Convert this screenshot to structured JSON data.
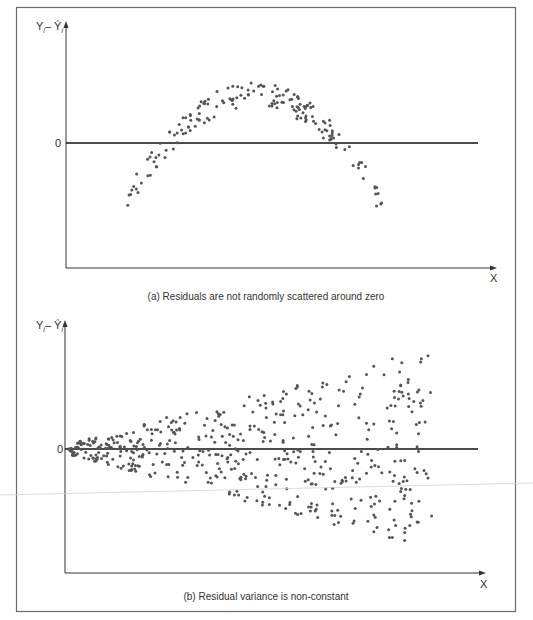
{
  "colors": {
    "frame": "#6a6a6a",
    "axis": "#333333",
    "zero_line": "#111111",
    "dot": "#555555",
    "stray_line": "#d0d0d0"
  },
  "chart_data": [
    {
      "type": "scatter",
      "title": "(a) Residuals are not randomly scattered around zero",
      "xlabel": "X",
      "ylabel": "Y_i − Ŷ_i",
      "ylabel_parts": {
        "main": "Y",
        "sub": "i",
        "sep": "– ",
        "hat": "Ŷ",
        "hat_sub": "i"
      },
      "y_tick_labels": [
        "0"
      ],
      "zero_tick": "0",
      "pattern": "inverted-U (curvilinear) residuals",
      "grid": false,
      "legend": null,
      "xlim": [
        0,
        100
      ],
      "ylim": [
        -100,
        100
      ],
      "points": []
    },
    {
      "type": "scatter",
      "title": "(b) Residual variance is non-constant",
      "xlabel": "X",
      "ylabel": "Y_i − Ŷ_i",
      "ylabel_parts": {
        "main": "Y",
        "sub": "i",
        "sep": "– ",
        "hat": "Ŷ",
        "hat_sub": "i"
      },
      "y_tick_labels": [
        "0"
      ],
      "zero_tick": "0",
      "pattern": "fan-shaped (heteroscedastic) residuals widening with X",
      "grid": false,
      "legend": null,
      "xlim": [
        0,
        100
      ],
      "ylim": [
        -100,
        100
      ],
      "points": []
    }
  ]
}
